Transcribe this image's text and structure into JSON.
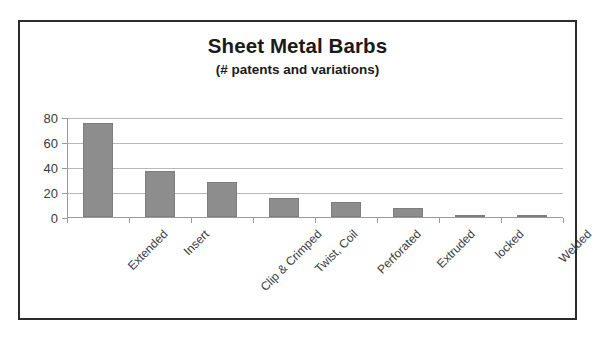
{
  "chart_data": {
    "type": "bar",
    "title": "Sheet Metal Barbs",
    "subtitle": "(# patents and variations)",
    "xlabel": "",
    "ylabel": "",
    "categories": [
      "Extended",
      "Insert",
      "Clip & Crimped",
      "Twist, Coil",
      "Perforated",
      "Extruded",
      "locked",
      "Welded"
    ],
    "values": [
      75,
      37,
      28,
      15,
      12,
      7,
      2,
      2
    ],
    "ylim": [
      0,
      80
    ],
    "yticks": [
      0,
      20,
      40,
      60,
      80
    ],
    "ytick_labels": [
      "0",
      "20",
      "40",
      "60",
      "80"
    ],
    "grid": true,
    "legend": false,
    "bar_color": "#8d8d8d",
    "frame_color": "#2b2b2b",
    "gridline_color": "#b8b8b8",
    "axis_color": "#9a9a9a",
    "text_color": "#1a1a1a",
    "background": "#ffffff"
  }
}
